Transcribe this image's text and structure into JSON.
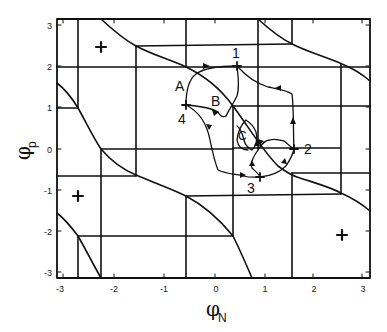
{
  "figure": {
    "xlabel": {
      "symbol": "φ",
      "subscript": "N"
    },
    "ylabel": {
      "symbol": "φ",
      "subscript": "p"
    },
    "x_ticks": [
      "-3",
      "-2",
      "-1",
      "0",
      "1",
      "2",
      "3"
    ],
    "y_ticks": [
      "3",
      "2",
      "1",
      "0",
      "-1",
      "-2",
      "-3"
    ],
    "xlim": [
      -3.14,
      3.14
    ],
    "ylim": [
      -3.14,
      3.14
    ],
    "point_labels": [
      "1",
      "2",
      "3",
      "4"
    ],
    "region_labels": [
      "A",
      "B",
      "C"
    ],
    "fixed_points": [
      {
        "phi_N": -2.3,
        "phi_p": 2.5,
        "marker": "+"
      },
      {
        "phi_N": -2.8,
        "phi_p": -1.1,
        "marker": "+"
      },
      {
        "phi_N": 2.55,
        "phi_p": -2.1,
        "marker": "+"
      }
    ],
    "orbit_points": [
      {
        "label": "1",
        "phi_N": 0.4,
        "phi_p": 2.05
      },
      {
        "label": "2",
        "phi_N": 1.6,
        "phi_p": 0.0
      },
      {
        "label": "3",
        "phi_N": 0.85,
        "phi_p": -0.6
      },
      {
        "label": "4",
        "phi_N": -0.6,
        "phi_p": 1.05
      }
    ]
  }
}
